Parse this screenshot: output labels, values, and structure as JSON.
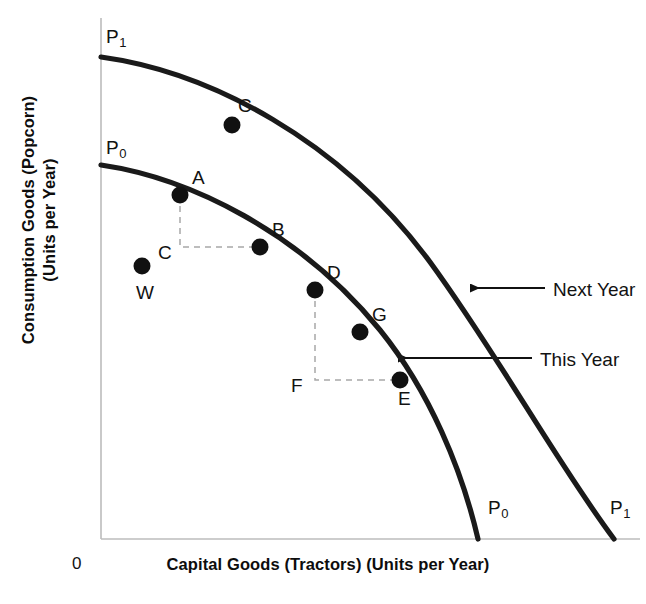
{
  "chart_data": {
    "type": "line",
    "title": "",
    "xlabel": "Capital Goods (Tractors) (Units per Year)",
    "ylabel_line1": "Consumption Goods (Popcorn)",
    "ylabel_line2": "(Units per Year)",
    "origin_label": "0",
    "axis_color": "#b9b9b9",
    "curve_color": "#1a1a1a",
    "point_color": "#111111",
    "guide_color": "#a8a8a8",
    "xlim": [
      0,
      1
    ],
    "ylim": [
      0,
      1
    ],
    "grid": false,
    "legend_position": "inline-callouts",
    "series": [
      {
        "name": "P0",
        "label": "P",
        "subscript": "0",
        "description": "This Year production possibilities frontier",
        "y_intercept_label": "P0",
        "x_intercept_label": "P0",
        "path": "M 101 165 C 190 178, 300 232, 380 330 C 430 392, 462 470, 478 539",
        "points": [
          {
            "id": "A",
            "label": "A",
            "x": 180,
            "y": 195,
            "label_dx": 12,
            "label_dy": -18
          },
          {
            "id": "B",
            "label": "B",
            "x": 260,
            "y": 247,
            "label_dx": 12,
            "label_dy": -18
          },
          {
            "id": "D",
            "label": "D",
            "x": 315,
            "y": 290,
            "label_dx": 12,
            "label_dy": -18
          },
          {
            "id": "G",
            "label": "G",
            "x": 360,
            "y": 332,
            "label_dx": 12,
            "label_dy": -18
          },
          {
            "id": "E",
            "label": "E",
            "x": 400,
            "y": 380,
            "label_dx": -2,
            "label_dy": 18
          }
        ]
      },
      {
        "name": "P1",
        "label": "P",
        "subscript": "1",
        "description": "Next Year production possibilities frontier",
        "y_intercept_label": "P1",
        "x_intercept_label": "P1",
        "path": "M 101 57 C 210 72, 340 140, 430 262 C 500 358, 555 460, 614 539",
        "points": [
          {
            "id": "C",
            "label": "C",
            "x": 232,
            "y": 125,
            "label_dx": 6,
            "label_dy": -20
          }
        ]
      }
    ],
    "interior_points": [
      {
        "id": "W",
        "label": "W",
        "x": 142,
        "y": 266,
        "label_dx": -6,
        "label_dy": 26,
        "description": "inefficient point inside the frontier"
      }
    ],
    "guide_lines": [
      {
        "id": "A-to-B",
        "from_point": "A",
        "to_point": "B",
        "corner_label": "C",
        "corner_x": 180,
        "corner_y": 247,
        "corner_label_dx": -22,
        "corner_label_dy": 6,
        "style": "dashed"
      },
      {
        "id": "D-to-E",
        "from_point": "D",
        "to_point": "E",
        "corner_label": "F",
        "corner_x": 315,
        "corner_y": 380,
        "corner_label_dx": -24,
        "corner_label_dy": 6,
        "style": "dashed"
      }
    ],
    "callouts": [
      {
        "id": "next-year",
        "text": "Next Year",
        "target_series": "P1",
        "arrow_tip_x": 470,
        "arrow_tip_y": 288,
        "arrow_tail_x": 545,
        "arrow_tail_y": 288,
        "text_x": 553,
        "text_y": 280
      },
      {
        "id": "this-year",
        "text": "This Year",
        "target_series": "P0",
        "arrow_tip_x": 398,
        "arrow_tip_y": 358,
        "arrow_tail_x": 532,
        "arrow_tail_y": 358,
        "text_x": 540,
        "text_y": 350
      }
    ],
    "curve_end_labels": [
      {
        "id": "p0-top",
        "label": "P",
        "subscript": "0",
        "x": 106,
        "y": 138
      },
      {
        "id": "p1-top",
        "label": "P",
        "subscript": "1",
        "x": 106,
        "y": 27
      },
      {
        "id": "p0-bottom",
        "label": "P",
        "subscript": "0",
        "x": 488,
        "y": 498
      },
      {
        "id": "p1-bottom",
        "label": "P",
        "subscript": "1",
        "x": 610,
        "y": 498
      }
    ],
    "axes": {
      "y_axis_x": 101,
      "y_axis_top": 18,
      "y_axis_bottom": 539,
      "x_axis_y": 539,
      "x_axis_left": 101,
      "x_axis_right": 640
    }
  }
}
